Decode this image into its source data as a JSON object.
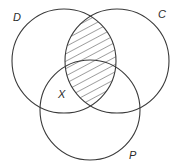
{
  "diagram": {
    "type": "venn",
    "sets": [
      {
        "id": "D",
        "label": "D",
        "cx": 64,
        "cy": 61,
        "r": 52,
        "label_x": 13,
        "label_y": 21
      },
      {
        "id": "C",
        "label": "C",
        "cx": 117,
        "cy": 61,
        "r": 52,
        "label_x": 158,
        "label_y": 18
      },
      {
        "id": "P",
        "label": "P",
        "cx": 90,
        "cy": 110,
        "r": 50,
        "label_x": 129,
        "label_y": 159
      }
    ],
    "region_labels": [
      {
        "label": "X",
        "x": 58,
        "y": 98
      }
    ],
    "shaded_region": "D ∩ C",
    "shading": "diagonal-hatch",
    "stroke_color": "#3a3a3a",
    "background": "#ffffff"
  }
}
